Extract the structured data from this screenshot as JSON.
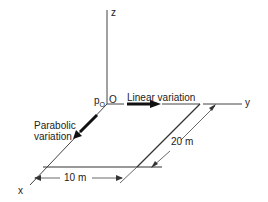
{
  "diagram": {
    "axes": {
      "z_label": "z",
      "y_label": "y",
      "x_label": "x",
      "origin_label": "O",
      "pressure_label": "p",
      "pressure_subscript": "O"
    },
    "annotations": {
      "linear": "Linear variation",
      "parabolic_line1": "Parabolic",
      "parabolic_line2": "variation"
    },
    "dimensions": {
      "length_y": "20 m",
      "length_x": "10 m"
    },
    "colors": {
      "line": "#333333",
      "arrow": "#111111",
      "text": "#222222"
    }
  }
}
